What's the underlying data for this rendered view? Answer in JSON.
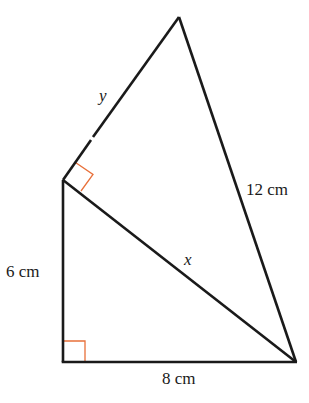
{
  "diagram": {
    "type": "geometry",
    "colors": {
      "line": "#1a1a1a",
      "right_angle_marker": "#e8703a",
      "background": "#ffffff"
    },
    "labels": {
      "y": "y",
      "twelve": "12 cm",
      "x": "x",
      "six": "6 cm",
      "eight": "8 cm"
    },
    "vertices": {
      "apex": [
        179,
        17
      ],
      "left": [
        63,
        180
      ],
      "bottom_left": [
        63,
        362
      ],
      "bottom_right": [
        296,
        362
      ]
    },
    "right_angles": [
      "bottom_left",
      "left"
    ]
  }
}
